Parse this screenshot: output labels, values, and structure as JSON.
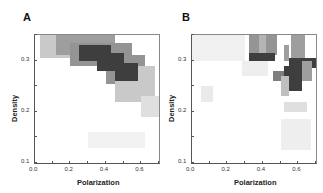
{
  "chart_data": [
    {
      "type": "heatmap",
      "panel": "A",
      "title": "A",
      "xlabel": "Polarization",
      "ylabel": "Density",
      "xlim": [
        0.0,
        0.7
      ],
      "ylim": [
        0.1,
        0.35
      ],
      "xticks": [
        "0.0",
        "0.2",
        "0.4",
        "0.6"
      ],
      "yticks": [
        "0.1",
        "0.2",
        "0.3"
      ],
      "grid": false,
      "description": "Diagonal band of high density running from upper-left (~0.05, 0.34) to lower-right (~0.68, 0.20); darkest core between polarization 0.25-0.58 and density 0.27-0.32; faint patch near (0.3-0.6, 0.13-0.16).",
      "cells": [
        {
          "x0": 0.03,
          "x1": 0.25,
          "y0": 0.305,
          "y1": 0.35,
          "level": 0.25
        },
        {
          "x0": 0.12,
          "x1": 0.45,
          "y0": 0.31,
          "y1": 0.35,
          "level": 0.45
        },
        {
          "x0": 0.2,
          "x1": 0.55,
          "y0": 0.29,
          "y1": 0.335,
          "level": 0.5
        },
        {
          "x0": 0.4,
          "x1": 0.62,
          "y0": 0.255,
          "y1": 0.31,
          "level": 0.5
        },
        {
          "x0": 0.45,
          "x1": 0.68,
          "y0": 0.22,
          "y1": 0.29,
          "level": 0.25
        },
        {
          "x0": 0.6,
          "x1": 0.7,
          "y0": 0.19,
          "y1": 0.23,
          "level": 0.15
        },
        {
          "x0": 0.25,
          "x1": 0.43,
          "y0": 0.3,
          "y1": 0.33,
          "level": 0.9
        },
        {
          "x0": 0.35,
          "x1": 0.5,
          "y0": 0.28,
          "y1": 0.315,
          "level": 0.9
        },
        {
          "x0": 0.45,
          "x1": 0.58,
          "y0": 0.26,
          "y1": 0.295,
          "level": 0.9
        },
        {
          "x0": 0.3,
          "x1": 0.62,
          "y0": 0.13,
          "y1": 0.16,
          "level": 0.06
        }
      ]
    },
    {
      "type": "heatmap",
      "panel": "B",
      "title": "B",
      "xlabel": "Polarization",
      "ylabel": "Density",
      "xlim": [
        0.0,
        0.7
      ],
      "ylim": [
        0.1,
        0.35
      ],
      "xticks": [
        "0.0",
        "0.2",
        "0.4",
        "0.6"
      ],
      "yticks": [
        "0.1",
        "0.2",
        "0.3"
      ],
      "grid": false,
      "description": "Sparse blocky distribution: dark cluster near polarization 0.32-0.47 at density ~0.30-0.31; dark vertical cluster near polarization 0.52-0.68, density 0.24-0.31; isolated gray patches at (0.05-0.1, 0.31-0.35) and (0.52-0.65, 0.13-0.18).",
      "cells": [
        {
          "x0": 0.05,
          "x1": 0.1,
          "y0": 0.31,
          "y1": 0.35,
          "level": 0.35
        },
        {
          "x0": 0.0,
          "x1": 0.3,
          "y0": 0.3,
          "y1": 0.35,
          "level": 0.07
        },
        {
          "x0": 0.32,
          "x1": 0.48,
          "y0": 0.31,
          "y1": 0.35,
          "level": 0.5
        },
        {
          "x0": 0.32,
          "x1": 0.47,
          "y0": 0.3,
          "y1": 0.315,
          "level": 0.9
        },
        {
          "x0": 0.38,
          "x1": 0.42,
          "y0": 0.315,
          "y1": 0.35,
          "level": 0.35
        },
        {
          "x0": 0.52,
          "x1": 0.55,
          "y0": 0.3,
          "y1": 0.33,
          "level": 0.45
        },
        {
          "x0": 0.56,
          "x1": 0.64,
          "y0": 0.29,
          "y1": 0.35,
          "level": 0.45
        },
        {
          "x0": 0.55,
          "x1": 0.7,
          "y0": 0.285,
          "y1": 0.305,
          "level": 0.9
        },
        {
          "x0": 0.52,
          "x1": 0.62,
          "y0": 0.24,
          "y1": 0.29,
          "level": 0.9
        },
        {
          "x0": 0.46,
          "x1": 0.52,
          "y0": 0.26,
          "y1": 0.28,
          "level": 0.6
        },
        {
          "x0": 0.62,
          "x1": 0.68,
          "y0": 0.26,
          "y1": 0.3,
          "level": 0.45
        },
        {
          "x0": 0.5,
          "x1": 0.55,
          "y0": 0.23,
          "y1": 0.27,
          "level": 0.3
        },
        {
          "x0": 0.52,
          "x1": 0.65,
          "y0": 0.2,
          "y1": 0.22,
          "level": 0.15
        },
        {
          "x0": 0.52,
          "x1": 0.65,
          "y0": 0.17,
          "y1": 0.178,
          "level": 0.6
        },
        {
          "x0": 0.52,
          "x1": 0.65,
          "y0": 0.13,
          "y1": 0.17,
          "level": 0.3
        },
        {
          "x0": 0.5,
          "x1": 0.67,
          "y0": 0.125,
          "y1": 0.185,
          "level": 0.08
        },
        {
          "x0": 0.05,
          "x1": 0.12,
          "y0": 0.22,
          "y1": 0.25,
          "level": 0.1
        },
        {
          "x0": 0.28,
          "x1": 0.43,
          "y0": 0.27,
          "y1": 0.3,
          "level": 0.08
        }
      ]
    }
  ],
  "panels": [
    {
      "label": "A",
      "xlabel": "Polarization",
      "ylabel": "Density"
    },
    {
      "label": "B",
      "xlabel": "Polarization",
      "ylabel": "Density"
    }
  ]
}
